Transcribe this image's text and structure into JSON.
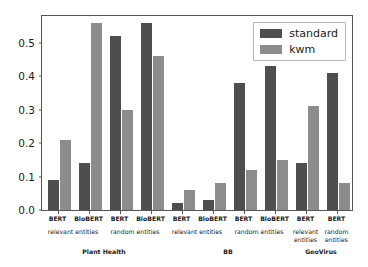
{
  "chart_data": {
    "type": "bar",
    "title": "",
    "xlabel": "",
    "ylabel": "",
    "ylim": [
      0.0,
      0.58
    ],
    "yticks": [
      "0.0",
      "0.1",
      "0.2",
      "0.3",
      "0.4",
      "0.5"
    ],
    "ytick_values": [
      0.0,
      0.1,
      0.2,
      0.3,
      0.4,
      0.5
    ],
    "grid": false,
    "legend_position": "upper right",
    "categories": [
      "BERT",
      "BioBERT",
      "BERT",
      "BioBERT",
      "BERT",
      "BioBERT",
      "BERT",
      "BioBERT",
      "BERT",
      "BERT"
    ],
    "series": [
      {
        "name": "standard",
        "color": "#4e4e4e",
        "values": [
          0.09,
          0.14,
          0.52,
          0.56,
          0.02,
          0.03,
          0.38,
          0.43,
          0.14,
          0.41
        ]
      },
      {
        "name": "kwm",
        "color": "#8c8c8c",
        "values": [
          0.21,
          0.56,
          0.3,
          0.46,
          0.06,
          0.08,
          0.12,
          0.15,
          0.31,
          0.08
        ]
      }
    ],
    "entity_groups": [
      {
        "label": "relevant entities",
        "span": [
          0,
          1
        ]
      },
      {
        "label": "random entities",
        "span": [
          2,
          3
        ]
      },
      {
        "label": "relevant entities",
        "span": [
          4,
          5
        ]
      },
      {
        "label": "random entities",
        "span": [
          6,
          7
        ]
      },
      {
        "label": "relevant\nentities",
        "span": [
          8,
          8
        ]
      },
      {
        "label": "random\nentities",
        "span": [
          9,
          9
        ]
      }
    ],
    "dataset_groups": [
      {
        "label": "Plant Health",
        "span": [
          0,
          3
        ]
      },
      {
        "label": "BB",
        "span": [
          4,
          7
        ]
      },
      {
        "label": "GeoVirus",
        "span": [
          8,
          9
        ]
      }
    ]
  },
  "legend": {
    "items": [
      {
        "label": "standard",
        "color": "#4e4e4e"
      },
      {
        "label": "kwm",
        "color": "#8c8c8c"
      }
    ]
  }
}
